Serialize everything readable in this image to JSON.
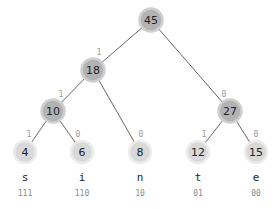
{
  "diagram": {
    "type": "huffman-tree",
    "root": "n45",
    "nodes": [
      {
        "id": "n45",
        "value": "45",
        "kind": "internal",
        "x": 151,
        "y": 20
      },
      {
        "id": "n18",
        "value": "18",
        "kind": "internal",
        "x": 93,
        "y": 70
      },
      {
        "id": "n10",
        "value": "10",
        "kind": "internal",
        "x": 53,
        "y": 111
      },
      {
        "id": "n27",
        "value": "27",
        "kind": "internal",
        "x": 230,
        "y": 111
      },
      {
        "id": "n4",
        "value": "4",
        "kind": "leaf",
        "x": 25,
        "y": 152,
        "symbol": "s",
        "code": "111"
      },
      {
        "id": "n6",
        "value": "6",
        "kind": "leaf",
        "x": 82,
        "y": 152,
        "symbol": "i",
        "code": "110"
      },
      {
        "id": "n8",
        "value": "8",
        "kind": "leaf",
        "x": 140,
        "y": 152,
        "symbol": "n",
        "code": "10"
      },
      {
        "id": "n12",
        "value": "12",
        "kind": "leaf",
        "x": 198,
        "y": 152,
        "symbol": "t",
        "code": "01"
      },
      {
        "id": "n15",
        "value": "15",
        "kind": "leaf",
        "x": 256,
        "y": 152,
        "symbol": "e",
        "code": "00"
      }
    ],
    "edges": [
      {
        "from": "n45",
        "to": "n18",
        "bit": "1",
        "label_x": 99,
        "label_y": 55
      },
      {
        "from": "n45",
        "to": "n27",
        "bit": "0",
        "label_x": 224,
        "label_y": 97
      },
      {
        "from": "n18",
        "to": "n10",
        "bit": "1",
        "label_x": 61,
        "label_y": 97
      },
      {
        "from": "n18",
        "to": "n8",
        "bit": "0",
        "label_x": 141,
        "label_y": 137
      },
      {
        "from": "n10",
        "to": "n4",
        "bit": "1",
        "label_x": 29,
        "label_y": 137
      },
      {
        "from": "n10",
        "to": "n6",
        "bit": "0",
        "label_x": 78,
        "label_y": 137
      },
      {
        "from": "n27",
        "to": "n12",
        "bit": "1",
        "label_x": 204,
        "label_y": 137
      },
      {
        "from": "n27",
        "to": "n15",
        "bit": "0",
        "label_x": 256,
        "label_y": 137
      }
    ],
    "symbol_row_y": 177,
    "code_row_y": 193
  },
  "colors": {
    "edge": "#555555",
    "internal_fill": "#b3b3b3",
    "leaf_fill": "#d9d9d9",
    "bit_label": "#9a9a9a",
    "code_text": "#8a8a8a",
    "text": "#222222"
  }
}
